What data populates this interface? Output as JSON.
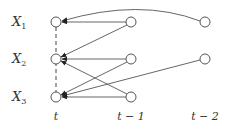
{
  "diagram": {
    "type": "dynamic-bayesian-network",
    "variables": [
      {
        "id": "X1",
        "base": "X",
        "sub": "1",
        "y": 22
      },
      {
        "id": "X2",
        "base": "X",
        "sub": "2",
        "y": 59
      },
      {
        "id": "X3",
        "base": "X",
        "sub": "3",
        "y": 97
      }
    ],
    "time_slices": [
      {
        "id": "t",
        "label": "t",
        "x": 56
      },
      {
        "id": "t-1",
        "label": "t − 1",
        "x": 131
      },
      {
        "id": "t-2",
        "label": "t − 2",
        "x": 205
      }
    ],
    "nodes": [
      {
        "var": "X1",
        "slice": "t"
      },
      {
        "var": "X2",
        "slice": "t"
      },
      {
        "var": "X3",
        "slice": "t"
      },
      {
        "var": "X1",
        "slice": "t-1"
      },
      {
        "var": "X2",
        "slice": "t-1"
      },
      {
        "var": "X3",
        "slice": "t-1"
      },
      {
        "var": "X1",
        "slice": "t-2"
      },
      {
        "var": "X2",
        "slice": "t-2"
      }
    ],
    "edges": [
      {
        "from": "X1@t-2",
        "to": "X1@t",
        "style": "curved"
      },
      {
        "from": "X1@t-1",
        "to": "X1@t",
        "style": "straight"
      },
      {
        "from": "X1@t-1",
        "to": "X2@t",
        "style": "straight"
      },
      {
        "from": "X2@t-1",
        "to": "X2@t",
        "style": "straight"
      },
      {
        "from": "X2@t-1",
        "to": "X3@t",
        "style": "straight"
      },
      {
        "from": "X3@t-1",
        "to": "X2@t",
        "style": "straight"
      },
      {
        "from": "X3@t-1",
        "to": "X3@t",
        "style": "straight"
      },
      {
        "from": "X2@t-2",
        "to": "X3@t",
        "style": "straight"
      }
    ],
    "contemporaneous": {
      "slice": "t",
      "style": "dashed",
      "connects": [
        "X1",
        "X2",
        "X3"
      ]
    },
    "colors": {
      "node_stroke": "#555555",
      "edge": "#666666",
      "text": "#333333"
    }
  }
}
